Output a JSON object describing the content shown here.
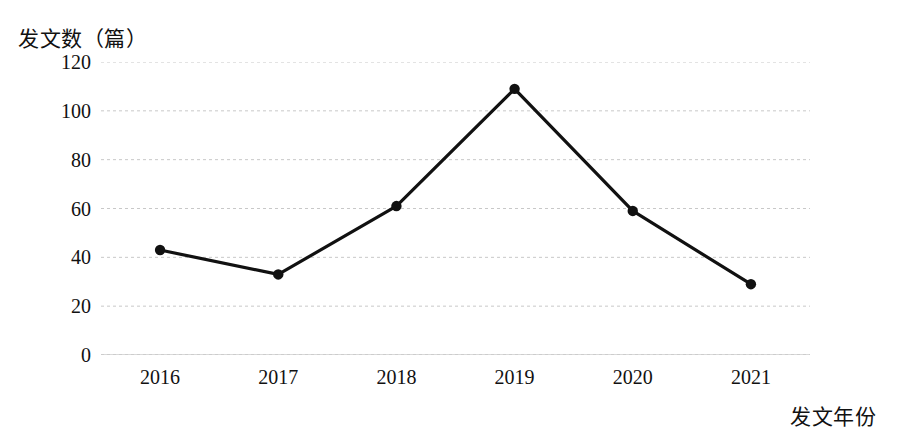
{
  "chart_data": {
    "type": "line",
    "title": "",
    "xlabel": "发文年份",
    "ylabel": "发文数（篇）",
    "categories": [
      "2016",
      "2017",
      "2018",
      "2019",
      "2020",
      "2021"
    ],
    "values": [
      43,
      33,
      61,
      109,
      59,
      29
    ],
    "series": [
      {
        "name": "发文数",
        "values": [
          43,
          33,
          61,
          109,
          59,
          29
        ]
      }
    ],
    "ylim": [
      0,
      120
    ],
    "yticks": [
      0,
      20,
      40,
      60,
      80,
      100,
      120
    ],
    "ytick_labels": [
      "0",
      "20",
      "40",
      "60",
      "80",
      "100",
      "120"
    ],
    "grid": true,
    "grid_style": "dashed-horizontal",
    "legend": "none",
    "line_color": "#111111",
    "marker": "circle",
    "marker_color": "#111111",
    "grid_color": "#c8c8c8",
    "axis_color": "#b4b4b4",
    "background": "#ffffff"
  },
  "axes": {
    "y_title": "发文数（篇）",
    "x_title": "发文年份"
  }
}
